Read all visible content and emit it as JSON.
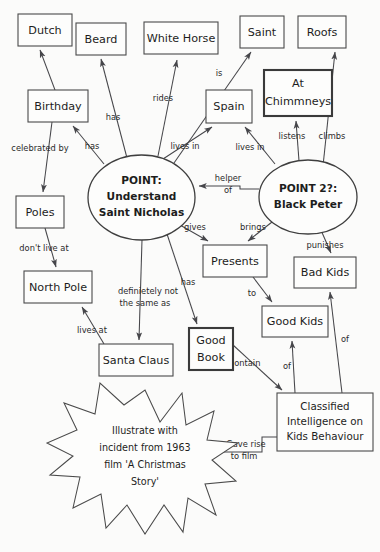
{
  "diagram": {
    "background_color": "#fbfbfa",
    "ink_color": "#46464a",
    "nodes": [
      {
        "id": "dutch",
        "label": "Dutch",
        "shape": "rect",
        "x": 18,
        "y": 14,
        "w": 54,
        "h": 32
      },
      {
        "id": "beard",
        "label": "Beard",
        "shape": "rect",
        "x": 76,
        "y": 23,
        "w": 50,
        "h": 32
      },
      {
        "id": "whitehorse",
        "label": "White Horse",
        "shape": "rect",
        "x": 144,
        "y": 22,
        "w": 74,
        "h": 32
      },
      {
        "id": "saint",
        "label": "Saint",
        "shape": "rect",
        "x": 240,
        "y": 16,
        "w": 44,
        "h": 32
      },
      {
        "id": "roofs",
        "label": "Roofs",
        "shape": "rect",
        "x": 298,
        "y": 16,
        "w": 48,
        "h": 32
      },
      {
        "id": "birthday",
        "label": "Birthday",
        "shape": "rect",
        "x": 28,
        "y": 90,
        "w": 60,
        "h": 32
      },
      {
        "id": "spain",
        "label": "Spain",
        "shape": "rect",
        "x": 206,
        "y": 90,
        "w": 46,
        "h": 33
      },
      {
        "id": "chimneys",
        "label": "At\nChimmneys",
        "shape": "rect2",
        "x": 264,
        "y": 70,
        "w": 68,
        "h": 46
      },
      {
        "id": "point1",
        "label": "POINT:\nUnderstand\nSaint Nicholas",
        "shape": "ellipse",
        "x": 88,
        "y": 155,
        "w": 107,
        "h": 85
      },
      {
        "id": "point2",
        "label": "POINT 2?:\nBlack Peter",
        "shape": "ellipse",
        "x": 259,
        "y": 160,
        "w": 98,
        "h": 74
      },
      {
        "id": "poles",
        "label": "Poles",
        "shape": "rect",
        "x": 16,
        "y": 196,
        "w": 48,
        "h": 32
      },
      {
        "id": "northpole",
        "label": "North Pole",
        "shape": "rect",
        "x": 24,
        "y": 271,
        "w": 68,
        "h": 32
      },
      {
        "id": "santa",
        "label": "Santa Claus",
        "shape": "rect",
        "x": 99,
        "y": 344,
        "w": 74,
        "h": 32
      },
      {
        "id": "goodbook",
        "label": "Good\nBook",
        "shape": "rect2",
        "x": 189,
        "y": 328,
        "w": 44,
        "h": 42
      },
      {
        "id": "presents",
        "label": "Presents",
        "shape": "rect",
        "x": 203,
        "y": 245,
        "w": 64,
        "h": 32
      },
      {
        "id": "goodkids",
        "label": "Good Kids",
        "shape": "rect",
        "x": 262,
        "y": 306,
        "w": 66,
        "h": 31
      },
      {
        "id": "badkids",
        "label": "Bad Kids",
        "shape": "rect",
        "x": 294,
        "y": 257,
        "w": 62,
        "h": 31
      },
      {
        "id": "classified",
        "label": "Classified\nIntelligence on\nKids Behaviour",
        "shape": "rect",
        "x": 277,
        "y": 393,
        "w": 96,
        "h": 58
      },
      {
        "id": "star",
        "label": "Illustrate with\nincident from 1963\nfilm 'A Christmas\nStory'",
        "shape": "star",
        "cx": 145,
        "cy": 457
      }
    ],
    "edges": [
      {
        "from": "birthday",
        "to": "dutch",
        "label": ""
      },
      {
        "from": "point1",
        "to": "beard",
        "label": "has"
      },
      {
        "from": "point1",
        "to": "whitehorse",
        "label": "rides"
      },
      {
        "from": "point1",
        "to": "saint",
        "label": "is"
      },
      {
        "from": "point1",
        "to": "birthday",
        "label": "has"
      },
      {
        "from": "birthday",
        "to": "poles",
        "label": "celebrated by"
      },
      {
        "from": "point1",
        "to": "spain",
        "label": "lives in"
      },
      {
        "from": "point2",
        "to": "spain",
        "label": "lives in"
      },
      {
        "from": "point2",
        "to": "chimneys",
        "label": "listens"
      },
      {
        "from": "point2",
        "to": "roofs",
        "label": "climbs"
      },
      {
        "from": "point2",
        "to": "point1",
        "label": "helper\nof"
      },
      {
        "from": "poles",
        "to": "northpole",
        "label": "don't live at"
      },
      {
        "from": "santa",
        "to": "northpole",
        "label": "lives at"
      },
      {
        "from": "point1",
        "to": "santa",
        "label": "definietely not\nthe same as"
      },
      {
        "from": "point1",
        "to": "goodbook",
        "label": "has"
      },
      {
        "from": "point1",
        "to": "presents",
        "label": "gives"
      },
      {
        "from": "point2",
        "to": "presents",
        "label": "brings"
      },
      {
        "from": "presents",
        "to": "goodkids",
        "label": "to"
      },
      {
        "from": "point2",
        "to": "badkids",
        "label": "punishes"
      },
      {
        "from": "goodbook",
        "to": "classified",
        "label": "contain"
      },
      {
        "from": "classified",
        "to": "goodkids",
        "label": "of"
      },
      {
        "from": "classified",
        "to": "badkids",
        "label": "of"
      },
      {
        "from": "classified",
        "to": "star",
        "label": "Gave rise\nto film"
      }
    ]
  }
}
